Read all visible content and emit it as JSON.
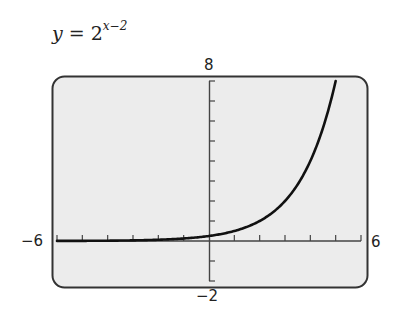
{
  "title": {
    "lhs": "y",
    "eq": " = 2",
    "exponent": "x−2"
  },
  "axis_labels": {
    "ymax": "8",
    "ymin": "−2",
    "xmin": "−6",
    "xmax": "6"
  },
  "colors": {
    "screen_bg": "#ececec",
    "curve": "#111111",
    "frame": "#333333"
  },
  "chart_data": {
    "type": "line",
    "function": "2^(x-2)",
    "xlabel": "",
    "ylabel": "",
    "xlim": [
      -6,
      6
    ],
    "ylim": [
      -2,
      8
    ],
    "xscale": 1,
    "yscale": 1,
    "grid": false,
    "series": [
      {
        "name": "y = 2^(x−2)",
        "x": [
          -6,
          -5,
          -4,
          -3,
          -2,
          -1,
          0,
          1,
          2,
          3,
          4,
          5
        ],
        "y": [
          0.0039,
          0.0078,
          0.0156,
          0.0313,
          0.0625,
          0.125,
          0.25,
          0.5,
          1,
          2,
          4,
          8
        ]
      }
    ]
  }
}
